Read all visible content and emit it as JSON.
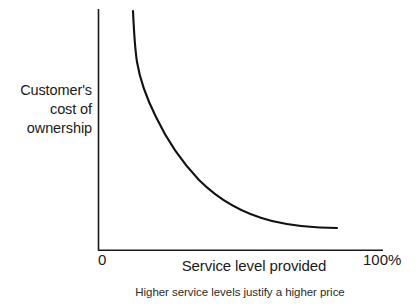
{
  "chart_data": {
    "type": "line",
    "title": "",
    "subtitle": "",
    "xlabel": "Service level provided",
    "ylabel": "Customer's cost of ownership",
    "ylabel_lines": [
      "Customer's",
      "cost of",
      "ownership"
    ],
    "caption": "Higher service levels justify a higher price",
    "grid": false,
    "legend": "none",
    "xlim": [
      0,
      100
    ],
    "ylim": [
      0,
      100
    ],
    "xticks": [
      "0",
      "100%"
    ],
    "xtick_min_label": "0",
    "xtick_max_label": "100%",
    "yticks": [],
    "axis_color": "#1a1a1a",
    "curve_color": "#111111",
    "background_color": "#ffffff",
    "series": [
      {
        "name": "Customer's cost of ownership vs service level",
        "shape": "decaying-hyperbolic",
        "x": [
          12,
          14,
          16,
          19,
          23,
          28,
          34,
          41,
          48,
          56,
          64,
          72,
          80,
          88,
          96
        ],
        "y": [
          100,
          82,
          70,
          59,
          50,
          42,
          35,
          29,
          24,
          20,
          16,
          13,
          11,
          10,
          9
        ]
      }
    ]
  },
  "figure": {
    "curve_path": "M 133,11 C 134,33 135,49 137,62 C 140,80 146,97 156,117 C 166,138 180,160 199,180 C 219,200 244,214 272,221 C 297,227 320,228 337,228",
    "y_axis": {
      "x": 98,
      "y_top": 9,
      "y_bottom": 250
    },
    "x_axis": {
      "y": 250,
      "x_left": 98,
      "x_right": 383
    }
  }
}
